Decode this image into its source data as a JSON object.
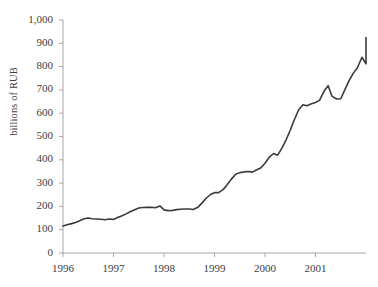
{
  "chart_data": {
    "type": "line",
    "title": "",
    "subtitle": "",
    "xlabel": "",
    "ylabel": "billions of RUB",
    "ylim": [
      0,
      1000
    ],
    "xlim": [
      1996.0,
      2001.83
    ],
    "grid": false,
    "legend": null,
    "y_ticks": [
      "0",
      "100",
      "200",
      "300",
      "400",
      "500",
      "600",
      "700",
      "800",
      "900",
      "1,000"
    ],
    "y_tick_values": [
      0,
      100,
      200,
      300,
      400,
      500,
      600,
      700,
      800,
      900,
      1000
    ],
    "x_ticks": [
      "1996",
      "1997",
      "1998",
      "1999",
      "2000",
      "2001"
    ],
    "x_tick_values": [
      1996,
      1997,
      1998,
      1999,
      2000,
      2001
    ],
    "series": [
      {
        "name": "billions of RUB",
        "color": "#3a3a3a",
        "line_width": 1.6,
        "x": [
          1996.0,
          1996.08,
          1996.17,
          1996.25,
          1996.33,
          1996.42,
          1996.5,
          1996.58,
          1996.67,
          1996.75,
          1996.83,
          1996.92,
          1997.0,
          1997.08,
          1997.17,
          1997.25,
          1997.33,
          1997.42,
          1997.5,
          1997.58,
          1997.67,
          1997.75,
          1997.83,
          1997.92,
          1998.0,
          1998.08,
          1998.17,
          1998.25,
          1998.33,
          1998.42,
          1998.5,
          1998.58,
          1998.67,
          1998.75,
          1998.83,
          1998.92,
          1999.0,
          1999.08,
          1999.17,
          1999.25,
          1999.33,
          1999.42,
          1999.5,
          1999.58,
          1999.67,
          1999.75,
          1999.83,
          1999.92,
          2000.0,
          2000.08,
          2000.17,
          2000.25,
          2000.33,
          2000.42,
          2000.5,
          2000.58,
          2000.67,
          2000.75,
          2000.83,
          2000.92,
          2001.0,
          2001.08,
          2001.17,
          2001.25,
          2001.33,
          2001.42,
          2001.5,
          2001.58,
          2001.67,
          2001.75,
          2001.83
        ],
        "values": [
          116,
          121,
          126,
          131,
          138,
          147,
          150,
          147,
          146,
          145,
          143,
          146,
          144,
          152,
          160,
          168,
          177,
          186,
          193,
          195,
          196,
          196,
          194,
          202,
          185,
          182,
          183,
          186,
          188,
          189,
          189,
          187,
          196,
          214,
          234,
          251,
          259,
          259,
          272,
          293,
          316,
          338,
          345,
          348,
          350,
          347,
          356,
          366,
          385,
          410,
          427,
          420,
          448,
          487,
          527,
          572,
          616,
          636,
          632,
          641,
          646,
          655,
          695,
          718,
          672,
          661,
          662,
          700,
          742,
          772,
          795
        ]
      }
    ],
    "series_tail": {
      "x": [
        2001.83,
        2001.92,
        2002.0
      ],
      "values": [
        795,
        840,
        812
      ]
    }
  },
  "axis": {
    "y_title": "billions of RUB",
    "line_color": "#a6a6a6"
  }
}
